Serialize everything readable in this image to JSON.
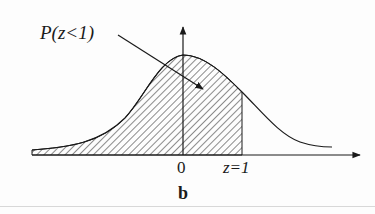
{
  "diagram": {
    "label_probability": "P(z<1)",
    "tick_zero": "0",
    "tick_z1": "z=1",
    "caption": "b",
    "distribution": "standard normal",
    "shaded_region": "z < 1"
  },
  "colors": {
    "ink": "#1a1a1a",
    "background": "#fdfdfd"
  }
}
